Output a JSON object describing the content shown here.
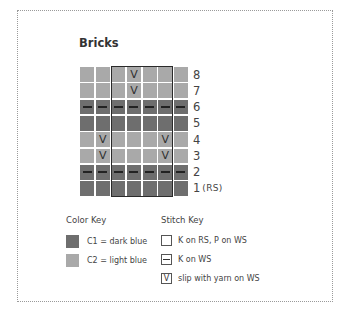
{
  "title": "Bricks",
  "chart": {
    "columns": 7,
    "rows": [
      {
        "row": 8,
        "color": "C2",
        "stitches": [
          "",
          "",
          "",
          "V",
          "",
          "",
          ""
        ]
      },
      {
        "row": 7,
        "color": "C2",
        "stitches": [
          "",
          "",
          "",
          "V",
          "",
          "",
          ""
        ]
      },
      {
        "row": 6,
        "color": "C1",
        "stitches": [
          "-",
          "-",
          "-",
          "-",
          "-",
          "-",
          "-"
        ]
      },
      {
        "row": 5,
        "color": "C1",
        "stitches": [
          "",
          "",
          "",
          "",
          "",
          "",
          ""
        ]
      },
      {
        "row": 4,
        "color": "C2",
        "stitches": [
          "",
          "V",
          "",
          "",
          "",
          "V",
          ""
        ]
      },
      {
        "row": 3,
        "color": "C2",
        "stitches": [
          "",
          "V",
          "",
          "",
          "",
          "V",
          ""
        ]
      },
      {
        "row": 2,
        "color": "C1",
        "stitches": [
          "-",
          "-",
          "-",
          "-",
          "-",
          "-",
          "-"
        ]
      },
      {
        "row": 1,
        "color": "C1",
        "stitches": [
          "",
          "",
          "",
          "",
          "",
          "",
          ""
        ]
      }
    ],
    "row_labels": [
      "8",
      "7",
      "6",
      "5",
      "4",
      "3",
      "2",
      "1"
    ],
    "rs_label": "(RS)",
    "repeat_box_columns": [
      3,
      6
    ]
  },
  "colors": {
    "C1": "#6e6e6e",
    "C2": "#a9a9a9"
  },
  "color_key": {
    "heading": "Color Key",
    "items": [
      {
        "id": "C1",
        "label": "C1 = dark blue",
        "swatch": "#6e6e6e"
      },
      {
        "id": "C2",
        "label": "C2 = light blue",
        "swatch": "#a9a9a9"
      }
    ]
  },
  "stitch_key": {
    "heading": "Stitch Key",
    "items": [
      {
        "symbol": "",
        "label": "K on RS, P on WS"
      },
      {
        "symbol": "-",
        "label": "K on WS"
      },
      {
        "symbol": "V",
        "label": "slip with yarn on WS"
      }
    ]
  }
}
